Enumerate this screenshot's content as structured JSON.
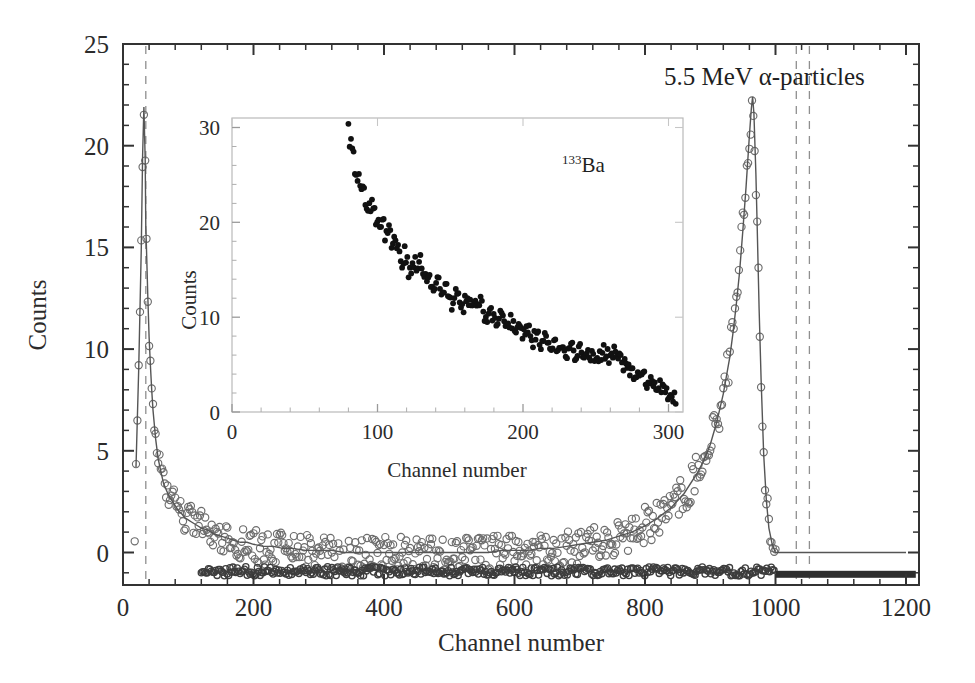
{
  "figure": {
    "background_color": "#ffffff",
    "foreground_color": "#2b2b2b",
    "annotation_main": "5.5 MeV α-particles",
    "annotation_inset_isotope_mass": "133",
    "annotation_inset_isotope_symbol": "Ba"
  },
  "chart_data": [
    {
      "type": "scatter",
      "name": "main-panel",
      "title": "",
      "annotation": "5.5 MeV α-particles",
      "xlabel": "Channel number",
      "ylabel": "Counts",
      "xlim": [
        0,
        1220
      ],
      "ylim": [
        -1.6,
        25
      ],
      "xticks": [
        0,
        200,
        400,
        600,
        800,
        1000,
        1200
      ],
      "xtick_labels": [
        "0",
        "200",
        "400",
        "600",
        "800",
        "1000",
        "1200"
      ],
      "yticks": [
        0,
        5,
        10,
        15,
        20,
        25
      ],
      "ytick_labels": [
        "0",
        "5",
        "10",
        "15",
        "20",
        "25"
      ],
      "minor_tick_count_x": 4,
      "minor_tick_count_y": 4,
      "grid": false,
      "legend": "none",
      "marker": "open-circle",
      "vertical_dashed_lines": [
        35,
        1032,
        1052
      ],
      "fit_curve_label": "fitted-background-curve",
      "baseline_bar_range": [
        1000,
        1215
      ],
      "series": [
        {
          "name": "counts-vs-channel",
          "x": [
            20,
            24,
            28,
            30,
            32,
            34,
            35,
            36,
            38,
            40,
            42,
            44,
            46,
            48,
            50,
            54,
            58,
            62,
            66,
            70,
            74,
            78,
            82,
            86,
            90,
            95,
            100,
            105,
            110,
            115,
            120,
            130,
            140,
            150,
            160,
            170,
            180,
            190,
            200,
            215,
            230,
            245,
            260,
            280,
            300,
            320,
            340,
            360,
            380,
            400,
            420,
            440,
            460,
            480,
            500,
            520,
            540,
            560,
            580,
            600,
            620,
            640,
            660,
            680,
            700,
            720,
            740,
            760,
            780,
            800,
            820,
            840,
            860,
            880,
            890,
            900,
            910,
            920,
            930,
            935,
            940,
            945,
            950,
            955,
            960,
            963,
            965,
            967,
            970,
            972,
            975,
            978,
            982,
            986,
            990,
            995,
            1000,
            1020,
            1060,
            1100,
            1150,
            1200
          ],
          "y": [
            4.2,
            9.0,
            15.0,
            19.5,
            21.9,
            19.3,
            16.0,
            14.9,
            12.6,
            10.6,
            9.2,
            8.0,
            7.0,
            6.3,
            5.6,
            4.6,
            4.0,
            3.4,
            3.1,
            2.8,
            2.6,
            2.4,
            2.2,
            2.0,
            1.9,
            1.7,
            1.6,
            1.5,
            1.4,
            1.3,
            1.2,
            1.1,
            0.9,
            0.8,
            0.7,
            0.6,
            0.5,
            0.5,
            0.4,
            0.3,
            0.3,
            0.2,
            0.2,
            0.1,
            0.1,
            0.1,
            0.0,
            0.0,
            0.0,
            0.0,
            0.0,
            0.0,
            0.0,
            0.0,
            0.0,
            0.0,
            0.0,
            0.0,
            0.1,
            0.1,
            0.1,
            0.2,
            0.2,
            0.3,
            0.4,
            0.5,
            0.6,
            0.8,
            1.0,
            1.3,
            1.7,
            2.2,
            2.9,
            3.9,
            4.5,
            5.3,
            6.4,
            7.8,
            9.6,
            10.8,
            12.2,
            13.8,
            15.8,
            18.0,
            20.5,
            21.8,
            22.4,
            21.6,
            18.6,
            16.0,
            12.0,
            8.5,
            4.8,
            2.6,
            1.2,
            0.4,
            0.0,
            0.0,
            0.0,
            0.0,
            0.0,
            0.0
          ]
        }
      ]
    },
    {
      "type": "scatter",
      "name": "inset-panel",
      "title": "",
      "annotation": "133Ba",
      "xlabel": "Channel number",
      "ylabel": "Counts",
      "xlim": [
        0,
        310
      ],
      "ylim": [
        0,
        31
      ],
      "xticks": [
        0,
        100,
        200,
        300
      ],
      "xtick_labels": [
        "0",
        "100",
        "200",
        "300"
      ],
      "yticks": [
        0,
        10,
        20,
        30
      ],
      "ytick_labels": [
        "0",
        "10",
        "20",
        "30"
      ],
      "minor_tick_count_x": 4,
      "minor_tick_count_y": 4,
      "grid": false,
      "legend": "none",
      "marker": "filled-circle",
      "series": [
        {
          "name": "ba133-counts-vs-channel",
          "x": [
            80,
            81,
            82,
            83,
            85,
            87,
            89,
            91,
            93,
            95,
            97,
            99,
            101,
            103,
            105,
            107,
            109,
            111,
            113,
            115,
            117,
            119,
            121,
            123,
            125,
            127,
            129,
            131,
            133,
            135,
            137,
            139,
            141,
            143,
            145,
            147,
            149,
            151,
            153,
            155,
            157,
            159,
            161,
            163,
            165,
            167,
            169,
            171,
            173,
            175,
            177,
            179,
            181,
            183,
            185,
            187,
            189,
            191,
            193,
            195,
            197,
            199,
            201,
            203,
            205,
            207,
            209,
            211,
            213,
            215,
            217,
            219,
            221,
            223,
            225,
            227,
            229,
            231,
            233,
            235,
            237,
            239,
            241,
            243,
            245,
            247,
            249,
            251,
            253,
            255,
            257,
            259,
            261,
            263,
            265,
            267,
            269,
            271,
            273,
            275,
            277,
            279,
            281,
            283,
            285,
            287,
            289,
            291,
            293,
            295,
            297,
            299,
            301,
            303,
            305
          ],
          "y": [
            30.3,
            28.5,
            27.8,
            26.9,
            25.5,
            24.3,
            23.8,
            22.6,
            22.1,
            21.5,
            22.3,
            20.4,
            19.6,
            20.8,
            18.5,
            19.7,
            18.2,
            17.4,
            17.9,
            16.8,
            16.1,
            17.0,
            15.4,
            14.6,
            15.8,
            15.1,
            16.3,
            14.2,
            13.5,
            14.8,
            13.9,
            12.8,
            14.0,
            13.2,
            12.4,
            13.6,
            12.0,
            11.4,
            12.6,
            13.1,
            11.9,
            10.9,
            12.2,
            11.6,
            10.4,
            11.1,
            10.6,
            11.8,
            10.1,
            9.6,
            10.8,
            10.3,
            9.2,
            9.9,
            10.5,
            9.4,
            8.8,
            9.7,
            9.1,
            8.4,
            9.3,
            8.6,
            8.0,
            8.9,
            8.2,
            7.5,
            8.3,
            7.8,
            7.1,
            7.9,
            7.3,
            6.8,
            7.6,
            7.0,
            6.5,
            7.2,
            6.7,
            6.1,
            6.9,
            6.4,
            5.8,
            6.6,
            6.2,
            5.6,
            6.3,
            6.0,
            5.5,
            6.1,
            5.9,
            6.4,
            6.2,
            5.8,
            6.5,
            6.3,
            6.0,
            5.4,
            5.1,
            4.6,
            4.2,
            3.9,
            4.3,
            3.7,
            3.4,
            3.8,
            3.2,
            2.9,
            3.3,
            2.7,
            2.4,
            2.8,
            2.2,
            1.9,
            2.3,
            1.7,
            1.5
          ]
        }
      ]
    }
  ]
}
